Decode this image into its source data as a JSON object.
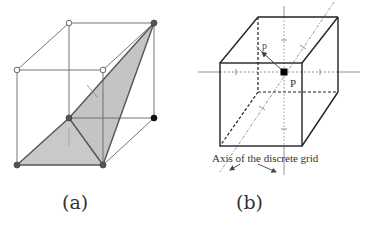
{
  "figure": {
    "panels": [
      {
        "id": "a",
        "caption": "(a)",
        "description": "Cube with shaded triangular surface (marching-cubes style configuration)",
        "colors": {
          "edge": "#555555",
          "fill": "#c8c8c8",
          "vertex_filled": "#333333",
          "vertex_hollow": "#ffffff"
        }
      },
      {
        "id": "b",
        "caption": "(b)",
        "point_label": "P",
        "projected_point_label": "p",
        "axis_annotation": "Axis of the discrete grid",
        "colors": {
          "edge": "#222222",
          "axis": "#777777",
          "point": "#000000"
        }
      }
    ]
  }
}
